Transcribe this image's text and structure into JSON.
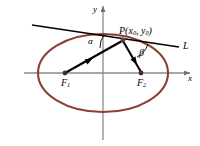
{
  "figure": {
    "colors": {
      "ellipse": "#8B4035",
      "axis": "#8a8a8a",
      "ray": "#000000",
      "tangent": "#000000",
      "background": "#ffffff"
    },
    "labels": {
      "point_p": "P(x0,  y0)",
      "point_p_base": "P(x",
      "point_p_sub1": "0",
      "point_p_mid": ",  y",
      "point_p_sub2": "0",
      "point_p_close": ")",
      "tangent_line": "L",
      "angle_alpha": "α",
      "angle_beta": "β",
      "focus_1_base": "F",
      "focus_1_sub": "1",
      "focus_2_base": "F",
      "focus_2_sub": "2",
      "axis_x": "x",
      "axis_y": "y"
    },
    "geometry": {
      "ellipse_center": [
        103,
        73
      ],
      "ellipse_rx": 65,
      "ellipse_ry": 39,
      "focus_1": [
        65,
        73
      ],
      "focus_2": [
        141,
        73
      ],
      "point_p": [
        123,
        40
      ],
      "tangent_start": [
        32,
        25
      ],
      "tangent_end": [
        179,
        47
      ],
      "x_axis_y": 73,
      "y_axis_x": 103
    }
  }
}
